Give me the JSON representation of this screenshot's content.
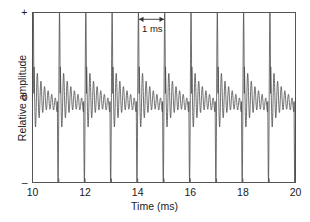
{
  "chart_data": {
    "type": "line",
    "title": "",
    "subtitle": "",
    "xlabel": "Time (ms)",
    "ylabel": "Relative amplitude",
    "xlim": [
      10,
      20
    ],
    "ylim": [
      -1,
      1
    ],
    "grid": false,
    "legend": "none",
    "line_color": "#4d4d4d",
    "frame_color": "#555555",
    "x_ticks": [
      10,
      11,
      12,
      13,
      14,
      15,
      16,
      17,
      18,
      19,
      20
    ],
    "x_tick_labels": [
      "10",
      "",
      "12",
      "",
      "14",
      "",
      "16",
      "",
      "18",
      "",
      "20"
    ],
    "y_ticks": [
      1,
      0,
      -1
    ],
    "y_tick_labels": [
      "+",
      "0",
      "–"
    ],
    "period_ms": 1,
    "n_periods": 10,
    "ringing_cycles_per_period": 6.5,
    "peak_positive": 1.0,
    "peak_negative": -1.0,
    "annotations": [
      {
        "label": "1 ms",
        "type": "double-arrow-span",
        "x_start": 14.05,
        "x_end": 15.0,
        "y": 0.92
      }
    ],
    "series": [
      {
        "name": "waveform",
        "x_start": 10,
        "x_end": 20,
        "samples": 2400
      }
    ]
  },
  "axes": {
    "x_tick_labels": [
      {
        "value": "10",
        "x": 10
      },
      {
        "value": "12",
        "x": 12
      },
      {
        "value": "14",
        "x": 14
      },
      {
        "value": "16",
        "x": 16
      },
      {
        "value": "18",
        "x": 18
      },
      {
        "value": "20",
        "x": 20
      }
    ],
    "y_tick_labels": [
      {
        "value": "+",
        "y": 1
      },
      {
        "value": "0",
        "y": 0
      },
      {
        "value": "–",
        "y": -1
      }
    ],
    "x_title": "Time (ms)",
    "y_title": "Relative amplitude"
  },
  "annotation": {
    "label": "1 ms"
  }
}
